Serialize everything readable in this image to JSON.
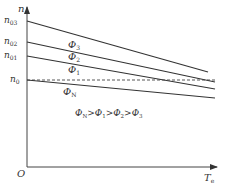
{
  "diagram": {
    "y_axis_label": "n",
    "x_axis_label": "T",
    "x_axis_label_sub": "e",
    "origin_label": "O",
    "y_ticks": [
      {
        "label": "n",
        "sub": "03"
      },
      {
        "label": "n",
        "sub": "02"
      },
      {
        "label": "n",
        "sub": "01"
      },
      {
        "label": "n",
        "sub": "0"
      }
    ],
    "curves": [
      {
        "name": "Φ",
        "sub": "3",
        "style": "solid"
      },
      {
        "name": "Φ",
        "sub": "2",
        "style": "solid"
      },
      {
        "name": "Φ",
        "sub": "1",
        "style": "solid"
      },
      {
        "name": "Φ",
        "sub": "N",
        "style": "solid"
      },
      {
        "name": "n0-reference",
        "style": "dashed"
      }
    ],
    "relation": {
      "terms": [
        {
          "name": "Φ",
          "sub": "N"
        },
        {
          "name": "Φ",
          "sub": "1"
        },
        {
          "name": "Φ",
          "sub": "2"
        },
        {
          "name": "Φ",
          "sub": "3"
        }
      ],
      "operator": ">"
    },
    "line_color": "#333333"
  }
}
